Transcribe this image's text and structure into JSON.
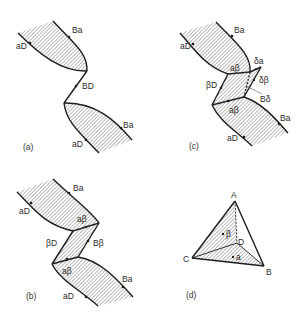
{
  "figure": {
    "panels": [
      {
        "id": "a",
        "caption": "(a)",
        "labels": {
          "top_aD": "aD",
          "top_Ba": "Ba",
          "bridge": "BD",
          "bottom_Ba": "Ba",
          "bottom_aD": "aD"
        }
      },
      {
        "id": "b",
        "caption": "(b)",
        "labels": {
          "top_aD": "aD",
          "top_Ba": "Ba",
          "top_ab": "aβ",
          "left": "βD",
          "right": "Bβ",
          "bottom_ab": "aβ",
          "bottom_Ba": "Ba",
          "bottom_aD": "aD"
        }
      },
      {
        "id": "c",
        "caption": "(c)",
        "labels": {
          "top_aD": "aD",
          "top_Ba": "Ba",
          "top_ab": "aβ",
          "da": "δa",
          "db": "δβ",
          "Bd": "Bδ",
          "left": "βD",
          "bottom_ab": "aβ",
          "bottom_Ba": "Ba",
          "bottom_aD": "aD"
        }
      },
      {
        "id": "d",
        "caption": "(d)",
        "labels": {
          "A": "A",
          "B": "B",
          "C": "C",
          "D": "D",
          "beta": "β",
          "alpha": "a"
        }
      }
    ],
    "colors": {
      "line": "#1e1e1e",
      "hatch": "#6a6a6a",
      "background": "#ffffff"
    }
  }
}
